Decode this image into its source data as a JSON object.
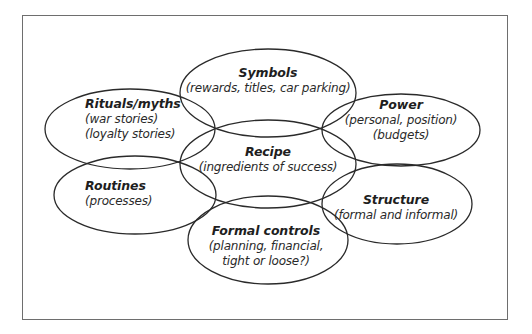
{
  "diagram": {
    "type": "overlapping-ellipses",
    "frame": {
      "border_color": "#6e6e6e",
      "background": "#ffffff"
    },
    "stroke_color": "#2a2a2a",
    "center_element": "recipe",
    "elements": [
      {
        "id": "symbols",
        "title": "Symbols",
        "lines": [
          "(rewards, titles, car parking)"
        ],
        "ellipse": {
          "cx": 268,
          "cy": 93,
          "rx": 88,
          "ry": 44
        }
      },
      {
        "id": "rituals",
        "title": "Rituals/myths",
        "lines": [
          "(war stories)",
          "(loyalty stories)"
        ],
        "ellipse": {
          "cx": 130,
          "cy": 129,
          "rx": 85,
          "ry": 40
        }
      },
      {
        "id": "power",
        "title": "Power",
        "lines": [
          "(personal, position)",
          "(budgets)"
        ],
        "ellipse": {
          "cx": 401,
          "cy": 130,
          "rx": 79,
          "ry": 36
        }
      },
      {
        "id": "recipe",
        "title": "Recipe",
        "lines": [
          "(ingredients of success)"
        ],
        "ellipse": {
          "cx": 268,
          "cy": 164,
          "rx": 88,
          "ry": 44
        }
      },
      {
        "id": "routines",
        "title": "Routines",
        "lines": [
          "(processes)"
        ],
        "ellipse": {
          "cx": 135,
          "cy": 195,
          "rx": 81,
          "ry": 39
        }
      },
      {
        "id": "structure",
        "title": "Structure",
        "lines": [
          "(formal and informal)"
        ],
        "ellipse": {
          "cx": 397,
          "cy": 204,
          "rx": 75,
          "ry": 40
        }
      },
      {
        "id": "formal_controls",
        "title": "Formal controls",
        "lines": [
          "(planning, financial,",
          "tight or loose?)"
        ],
        "ellipse": {
          "cx": 268,
          "cy": 240,
          "rx": 80,
          "ry": 44
        }
      }
    ]
  }
}
